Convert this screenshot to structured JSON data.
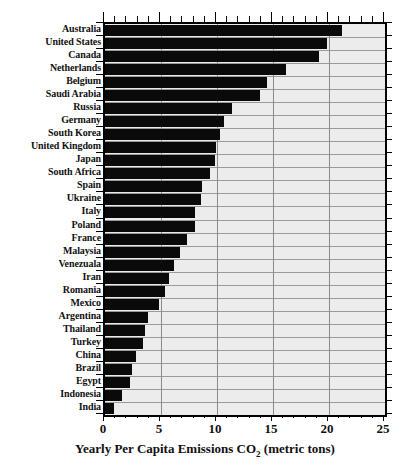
{
  "chart_data": {
    "type": "bar",
    "orientation": "horizontal",
    "title": "",
    "xlabel": "Yearly Per Capita Emissions CO2 (metric tons)",
    "xlabel_main": "Yearly Per Capita Emissions CO",
    "xlabel_sub": "2",
    "xlabel_tail": " (metric tons)",
    "ylabel": "",
    "xlim": [
      0,
      25
    ],
    "xticks": [
      0,
      5,
      10,
      15,
      20,
      25
    ],
    "xtick_labels": [
      "0",
      "5",
      "10",
      "15",
      "20",
      "25"
    ],
    "minor_tick_step": 1,
    "grid": "both",
    "legend": "none",
    "bar_color": "#0a0a0a",
    "plot_background": "#ececec",
    "gridline_color": "#8a8a8a",
    "categories": [
      "Australia",
      "United States",
      "Canada",
      "Netherlands",
      "Belgium",
      "Saudi Arabia",
      "Russia",
      "Germany",
      "South Korea",
      "United Kingdom",
      "Japan",
      "South Africa",
      "Spain",
      "Ukraine",
      "Italy",
      "Poland",
      "France",
      "Malaysia",
      "Venezuala",
      "Iran",
      "Romania",
      "Mexico",
      "Argentina",
      "Thailand",
      "Turkey",
      "China",
      "Brazil",
      "Egypt",
      "Indonesia",
      "India"
    ],
    "values": [
      21.2,
      19.8,
      19.1,
      16.2,
      14.5,
      13.8,
      11.3,
      10.6,
      10.3,
      9.9,
      9.8,
      9.4,
      8.7,
      8.6,
      8.0,
      8.0,
      7.3,
      6.7,
      6.2,
      5.7,
      5.4,
      4.8,
      3.8,
      3.6,
      3.4,
      2.8,
      2.4,
      2.2,
      1.5,
      0.8
    ]
  }
}
